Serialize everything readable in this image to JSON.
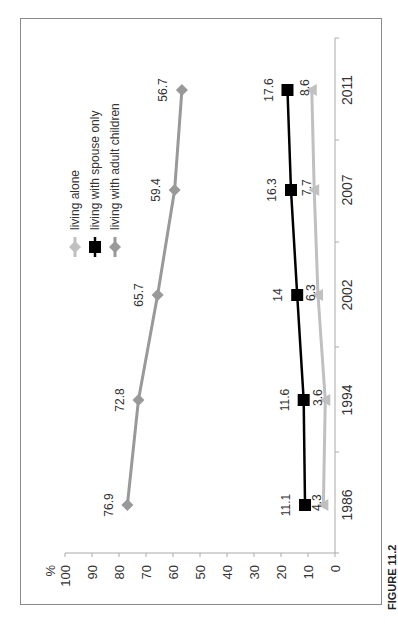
{
  "chart_data": {
    "type": "line",
    "orientation": "rotated-90-ccw",
    "title": "",
    "xlabel": "",
    "ylabel": "%",
    "ylim": [
      0,
      100
    ],
    "yticks": [
      0,
      10,
      20,
      30,
      40,
      50,
      60,
      70,
      80,
      90,
      100
    ],
    "categories": [
      "1986",
      "1994",
      "2002",
      "2007",
      "2011"
    ],
    "series": [
      {
        "name": "living alone",
        "marker": "triangle",
        "color": "#c0c0c0",
        "values": [
          4.3,
          3.6,
          6.3,
          7.7,
          8.6
        ]
      },
      {
        "name": "living with spouse only",
        "marker": "square",
        "color": "#000000",
        "values": [
          11.1,
          11.6,
          14,
          16.3,
          17.6
        ]
      },
      {
        "name": "living with adult children",
        "marker": "diamond",
        "color": "#999999",
        "values": [
          76.9,
          72.8,
          65.7,
          59.4,
          56.7
        ]
      }
    ],
    "data_labels": {
      "living alone": [
        "4.3",
        "3.6",
        "6.3",
        "7.7",
        "8.6"
      ],
      "living with spouse only": [
        "11.1",
        "11.6",
        "14",
        "16.3",
        "17.6"
      ],
      "living with adult children": [
        "76.9",
        "72.8",
        "65.7",
        "59.4",
        "56.7"
      ]
    },
    "grid": false,
    "legend_position": "upper-left (rotated)"
  },
  "caption": "FIGURE 11.2"
}
